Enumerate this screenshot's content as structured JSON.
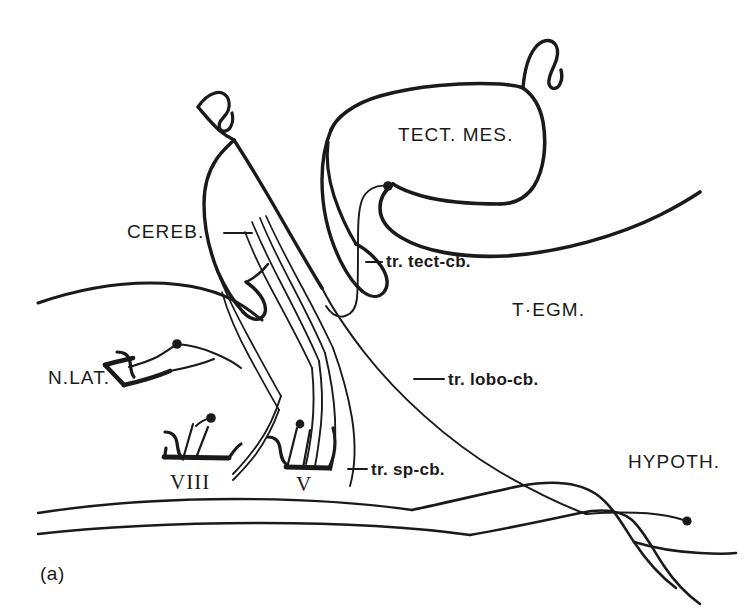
{
  "figure": {
    "panel_label": "(a)",
    "caption_present": false,
    "background_color": "#ffffff",
    "ink_color": "#1a1a1a"
  },
  "labels": [
    {
      "id": "cereb",
      "text": "CEREB.",
      "style": "caps",
      "x": 127,
      "y": 222,
      "leader": true
    },
    {
      "id": "tect_mes",
      "text": "TECT. MES.",
      "style": "caps",
      "x": 398,
      "y": 125,
      "leader": false
    },
    {
      "id": "tegm",
      "text": "T·EGM.",
      "style": "caps",
      "x": 512,
      "y": 300,
      "leader": false
    },
    {
      "id": "hypoth",
      "text": "HYPOTH.",
      "style": "caps",
      "x": 628,
      "y": 452,
      "leader": false
    },
    {
      "id": "n_lat",
      "text": "N.LAT.",
      "style": "caps",
      "x": 48,
      "y": 368,
      "leader": false
    },
    {
      "id": "tr_tect_cb",
      "text": "tr. tect-cb.",
      "style": "tract",
      "x": 378,
      "y": 253,
      "leader": true
    },
    {
      "id": "tr_lobo_cb",
      "text": "tr. lobo-cb.",
      "style": "tract",
      "x": 440,
      "y": 371,
      "leader": true
    },
    {
      "id": "tr_sp_cb",
      "text": "tr. sp-cb.",
      "style": "tract",
      "x": 363,
      "y": 461,
      "leader": true
    },
    {
      "id": "viii",
      "text": "VIII",
      "style": "roman",
      "x": 170,
      "y": 472,
      "leader": false
    },
    {
      "id": "v",
      "text": "V",
      "style": "roman",
      "x": 296,
      "y": 474,
      "leader": false
    }
  ],
  "structures": [
    {
      "id": "cerebellum",
      "name": "Cerebellum (CEREB.)"
    },
    {
      "id": "tectum-mesencephali",
      "name": "Tectum mesencephali (TECT. MES.)"
    },
    {
      "id": "tegmentum",
      "name": "Tegmentum (T·EGM.)"
    },
    {
      "id": "hypothalamus",
      "name": "Hypothalamus (HYPOTH.)"
    },
    {
      "id": "nucleus-lateralis",
      "name": "Nucleus lateralis (N.LAT.)"
    },
    {
      "id": "nerve-viii",
      "name": "Cranial nerve VIII"
    },
    {
      "id": "nerve-v",
      "name": "Cranial nerve V"
    }
  ],
  "tracts": [
    {
      "id": "tr-tect-cb",
      "name": "tr. tect-cb.",
      "terminal_dot": true
    },
    {
      "id": "tr-lobo-cb",
      "name": "tr. lobo-cb.",
      "terminal_dot": true
    },
    {
      "id": "tr-sp-cb",
      "name": "tr. sp-cb.",
      "terminal_dot": true
    }
  ]
}
